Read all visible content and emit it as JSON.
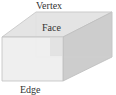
{
  "diagram": {
    "type": "rectangular-prism",
    "labels": {
      "vertex": "Vertex",
      "face": "Face",
      "edge": "Edge"
    },
    "colors": {
      "front_face": "#ebebeb",
      "top_face": "#e2e2e2",
      "right_face": "#cfcfcf",
      "edge_line": "#bdbdbd",
      "label_text": "#333333",
      "background": "#ffffff"
    }
  }
}
